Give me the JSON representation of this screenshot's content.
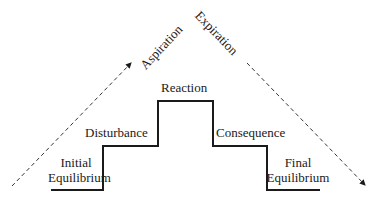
{
  "diagram": {
    "type": "staircase-process",
    "colors": {
      "line": "#1a1a1a",
      "dashed": "#333333",
      "background": "#ffffff"
    },
    "stages": [
      {
        "id": "initial",
        "line1": "Initial",
        "line2": "Equilibrium"
      },
      {
        "id": "disturbance",
        "label": "Disturbance"
      },
      {
        "id": "reaction",
        "label": "Reaction"
      },
      {
        "id": "consequence",
        "label": "Consequence"
      },
      {
        "id": "final",
        "line1": "Final",
        "line2": "Equilibrium"
      }
    ],
    "arrows": {
      "left": {
        "label": "Aspiration",
        "direction": "up-right"
      },
      "right": {
        "label": "Expiration",
        "direction": "down-right"
      }
    }
  }
}
